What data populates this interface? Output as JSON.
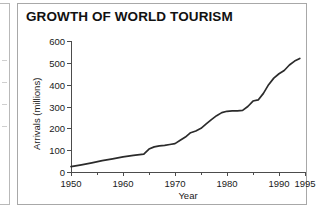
{
  "figure": {
    "title": "GROWTH OF WORLD TOURISM",
    "axis_title_y": "Arrivals (millions)",
    "axis_title_x": "Year"
  },
  "chart_data": {
    "type": "line",
    "title": "GROWTH OF WORLD TOURISM",
    "xlabel": "Year",
    "ylabel": "Arrivals (millions)",
    "xlim": [
      1950,
      1995
    ],
    "ylim": [
      0,
      600
    ],
    "grid": false,
    "legend": null,
    "x_ticks_major": [
      1950,
      1960,
      1970,
      1980,
      1990,
      1995
    ],
    "x_ticks_minor": [
      1955,
      1965,
      1975,
      1985
    ],
    "y_ticks": [
      0,
      100,
      200,
      300,
      400,
      500,
      600
    ],
    "line_color": "#2b2b2b",
    "series": [
      {
        "name": "International tourist arrivals",
        "x": [
          1950,
          1952,
          1954,
          1956,
          1958,
          1960,
          1962,
          1964,
          1965,
          1966,
          1967,
          1968,
          1969,
          1970,
          1971,
          1972,
          1973,
          1974,
          1975,
          1976,
          1977,
          1978,
          1979,
          1980,
          1981,
          1982,
          1983,
          1984,
          1985,
          1986,
          1987,
          1988,
          1989,
          1990,
          1991,
          1992,
          1993,
          1994
        ],
        "values": [
          25,
          33,
          42,
          52,
          60,
          69,
          76,
          82,
          105,
          115,
          120,
          122,
          126,
          130,
          145,
          160,
          180,
          188,
          200,
          220,
          240,
          258,
          272,
          278,
          280,
          280,
          282,
          300,
          325,
          330,
          360,
          400,
          430,
          450,
          465,
          490,
          508,
          520
        ]
      }
    ]
  }
}
